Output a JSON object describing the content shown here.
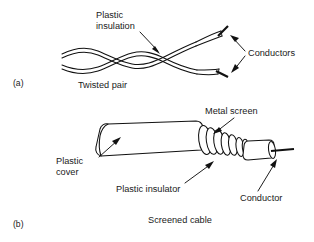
{
  "figure": {
    "title_implicit": "Transmission line cable types",
    "background_color": "#ffffff",
    "ink_color": "#111111"
  },
  "panel_a": {
    "marker": "(a)",
    "caption": "Twisted pair",
    "labels": {
      "plastic_insulation_line1": "Plastic",
      "plastic_insulation_line2": "insulation",
      "conductors": "Conductors"
    },
    "parts": [
      "Plastic insulation",
      "Conductors"
    ]
  },
  "panel_b": {
    "marker": "(b)",
    "caption": "Screened cable",
    "labels": {
      "metal_screen": "Metal screen",
      "plastic_cover_line1": "Plastic",
      "plastic_cover_line2": "cover",
      "plastic_insulator": "Plastic insulator",
      "conductor": "Conductor"
    },
    "parts": [
      "Metal screen",
      "Plastic cover",
      "Plastic insulator",
      "Conductor"
    ]
  }
}
